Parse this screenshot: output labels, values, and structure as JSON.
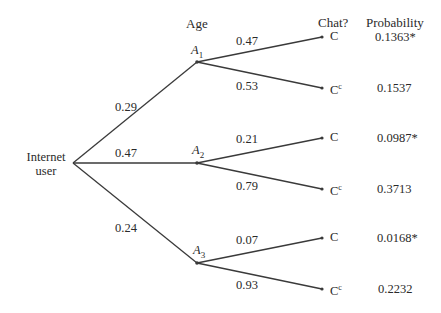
{
  "headers": {
    "age": "Age",
    "chat": "Chat?",
    "probability": "Probability"
  },
  "root": {
    "label_line1": "Internet",
    "label_line2": "user"
  },
  "ages": [
    {
      "name": "A",
      "sub": "1",
      "branch_prob": "0.29",
      "chat": [
        {
          "label": "C",
          "sup": "",
          "branch_prob": "0.47",
          "joint": "0.1363*"
        },
        {
          "label": "C",
          "sup": "c",
          "branch_prob": "0.53",
          "joint": "0.1537"
        }
      ]
    },
    {
      "name": "A",
      "sub": "2",
      "branch_prob": "0.47",
      "chat": [
        {
          "label": "C",
          "sup": "",
          "branch_prob": "0.21",
          "joint": "0.0987*"
        },
        {
          "label": "C",
          "sup": "c",
          "branch_prob": "0.79",
          "joint": "0.3713"
        }
      ]
    },
    {
      "name": "A",
      "sub": "3",
      "branch_prob": "0.24",
      "chat": [
        {
          "label": "C",
          "sup": "",
          "branch_prob": "0.07",
          "joint": "0.0168*"
        },
        {
          "label": "C",
          "sup": "c",
          "branch_prob": "0.93",
          "joint": "0.2232"
        }
      ]
    }
  ],
  "colors": {
    "line": "#3a3a3a",
    "text": "#2a2a2a",
    "background": "#ffffff"
  }
}
